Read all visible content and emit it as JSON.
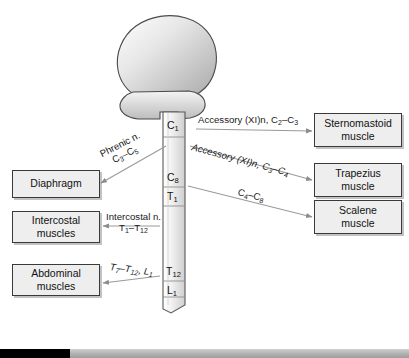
{
  "figure": {
    "brain_label": "brain-and-brainstem",
    "background_color": "#ffffff",
    "box_fill": "#eeeeee",
    "box_border": "#3a3a3a",
    "cord_fill": "#f0f0f0"
  },
  "cord_segments": [
    {
      "id": "c1",
      "label": "C",
      "sub": "1"
    },
    {
      "id": "c8",
      "label": "C",
      "sub": "8"
    },
    {
      "id": "t1",
      "label": "T",
      "sub": "1"
    },
    {
      "id": "t12",
      "label": "T",
      "sub": "12"
    },
    {
      "id": "l1",
      "label": "L",
      "sub": "1"
    }
  ],
  "right_targets": [
    {
      "id": "sternomastoid",
      "line1": "Sternomastoid",
      "line2": "muscle"
    },
    {
      "id": "trapezius",
      "line1": "Trapezius",
      "line2": "muscle"
    },
    {
      "id": "scalene",
      "line1": "Scalene",
      "line2": "muscle"
    }
  ],
  "left_targets": [
    {
      "id": "diaphragm",
      "line1": "Diaphragm",
      "line2": ""
    },
    {
      "id": "intercostal",
      "line1": "Intercostal",
      "line2": "muscles"
    },
    {
      "id": "abdominal",
      "line1": "Abdominal",
      "line2": "muscles"
    }
  ],
  "pathways": {
    "accessory_sternomastoid": {
      "nerve": "Accessory (XI)n,",
      "levels_from": "C",
      "levels_from_sub": "2",
      "levels_to": "C",
      "levels_to_sub": "3",
      "full": "Accessory (XI)n, C2–C3"
    },
    "accessory_trapezius": {
      "nerve": "Accessory (XI)n,",
      "levels_from": "C",
      "levels_from_sub": "3",
      "levels_to": "C",
      "levels_to_sub": "4",
      "full": "Accessory (XI)n, C3–C4"
    },
    "scalene": {
      "nerve": "",
      "levels_from": "C",
      "levels_from_sub": "4",
      "levels_to": "C",
      "levels_to_sub": "8",
      "full": "C4–C8"
    },
    "phrenic": {
      "nerve": "Phrenic n.",
      "levels_from": "C",
      "levels_from_sub": "3",
      "levels_to": "C",
      "levels_to_sub": "5",
      "full": "Phrenic n. C3–C5"
    },
    "intercostal": {
      "nerve": "Intercostal n.",
      "levels_from": "T",
      "levels_from_sub": "1",
      "levels_to": "T",
      "levels_to_sub": "12",
      "full": "Intercostal n. T1–T12"
    },
    "abdominal": {
      "nerve": "",
      "levels_from": "T",
      "levels_from_sub": "7",
      "levels_mid": "T",
      "levels_mid_sub": "12",
      "levels_to": "L",
      "levels_to_sub": "1",
      "full": "T7–T12, L1"
    }
  },
  "footer": {
    "fill_percent": 17,
    "fill_color": "#000000",
    "track_color": "#b4b4b4"
  }
}
